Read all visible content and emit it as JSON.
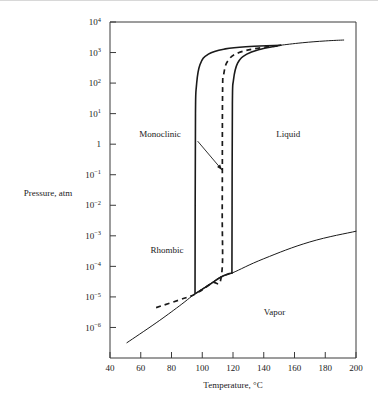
{
  "figure": {
    "name": "sulfur-phase-diagram",
    "background_color": "#ffffff",
    "line_color": "#1a1a1a"
  },
  "chart_data": {
    "type": "line",
    "title": "",
    "subtitle": "",
    "xlabel": "Temperature, °C",
    "ylabel": "Pressure, atm",
    "xlim": [
      40,
      200
    ],
    "ylim_log10": [
      -7,
      4
    ],
    "x_scale": "linear",
    "y_scale": "log",
    "grid": false,
    "legend_position": "none",
    "x_ticks": [
      40,
      60,
      80,
      100,
      120,
      140,
      160,
      180,
      200
    ],
    "x_tick_labels": [
      "40",
      "60",
      "80",
      "100",
      "120",
      "140",
      "160",
      "180",
      "200"
    ],
    "y_ticks_log10": [
      4,
      3,
      2,
      1,
      0,
      -1,
      -2,
      -3,
      -4,
      -5,
      -6
    ],
    "y_tick_labels": [
      {
        "mantissa": "10",
        "exponent": "4"
      },
      {
        "mantissa": "10",
        "exponent": "3"
      },
      {
        "mantissa": "10",
        "exponent": "2"
      },
      {
        "mantissa": "10",
        "exponent": "1"
      },
      {
        "mantissa": "1",
        "exponent": ""
      },
      {
        "mantissa": "10",
        "exponent": "−1"
      },
      {
        "mantissa": "10",
        "exponent": "−2"
      },
      {
        "mantissa": "10",
        "exponent": "−3"
      },
      {
        "mantissa": "10",
        "exponent": "−4"
      },
      {
        "mantissa": "10",
        "exponent": "−5"
      },
      {
        "mantissa": "10",
        "exponent": "−6"
      }
    ],
    "region_labels": [
      {
        "name": "rhombic",
        "text": "Rhombic",
        "x": 77,
        "y_log10": -3.55
      },
      {
        "name": "monoclinic",
        "text": "Monoclinic",
        "x": 86,
        "y_log10": 0.25
      },
      {
        "name": "liquid",
        "text": "Liquid",
        "x": 156,
        "y_log10": 0.25
      },
      {
        "name": "vapor",
        "text": "Vapor",
        "x": 147,
        "y_log10": -5.6
      }
    ],
    "annotations": [
      {
        "name": "monoclinic-leader",
        "label": "Monoclinic",
        "from_x": 97,
        "from_y_log10": 0.1,
        "to_x": 113,
        "to_y_log10": -0.85
      }
    ],
    "series": [
      {
        "name": "rhombic-monoclinic-boundary",
        "style": "solid-heavy",
        "description": "Vertical solid line from lower triple point up to the monoclinic-liquid junction near 1000 atm",
        "points": [
          {
            "x": 95.3,
            "y_log10": -4.88
          },
          {
            "x": 95.4,
            "y_log10": -2.0
          },
          {
            "x": 95.6,
            "y_log10": 1.0
          },
          {
            "x": 96.2,
            "y_log10": 1.9
          },
          {
            "x": 98.5,
            "y_log10": 2.6
          },
          {
            "x": 104.0,
            "y_log10": 2.95
          },
          {
            "x": 115.0,
            "y_log10": 3.12
          },
          {
            "x": 131.0,
            "y_log10": 3.2
          },
          {
            "x": 151.0,
            "y_log10": 3.24
          }
        ]
      },
      {
        "name": "monoclinic-liquid-boundary",
        "style": "solid-heavy",
        "description": "Vertical solid line from upper end of vaporization curve up to the high-pressure triple point",
        "points": [
          {
            "x": 119.3,
            "y_log10": -4.22
          },
          {
            "x": 119.4,
            "y_log10": -2.0
          },
          {
            "x": 119.6,
            "y_log10": 1.3
          },
          {
            "x": 120.3,
            "y_log10": 2.1
          },
          {
            "x": 123.0,
            "y_log10": 2.65
          },
          {
            "x": 129.0,
            "y_log10": 2.95
          },
          {
            "x": 138.0,
            "y_log10": 3.11
          },
          {
            "x": 151.0,
            "y_log10": 3.24
          }
        ]
      },
      {
        "name": "liquid-vapor-and-upper-branch",
        "style": "solid-thin",
        "description": "Upper continuation of the solid boundary beyond the high-pressure triple point toward 200 C",
        "points": [
          {
            "x": 151.0,
            "y_log10": 3.24
          },
          {
            "x": 165.0,
            "y_log10": 3.32
          },
          {
            "x": 180.0,
            "y_log10": 3.38
          },
          {
            "x": 192.0,
            "y_log10": 3.41
          }
        ]
      },
      {
        "name": "metastable-rhombic-monoclinic-dashed",
        "style": "dashed",
        "description": "Dashed metastable rhombic-liquid boundary, vertical near 113 C",
        "points": [
          {
            "x": 70.0,
            "y_log10": -5.35
          },
          {
            "x": 85.0,
            "y_log10": -5.1
          },
          {
            "x": 95.5,
            "y_log10": -4.9
          },
          {
            "x": 106.0,
            "y_log10": -4.55
          },
          {
            "x": 112.5,
            "y_log10": -4.3
          },
          {
            "x": 113.0,
            "y_log10": -2.0
          },
          {
            "x": 113.2,
            "y_log10": 1.6
          },
          {
            "x": 114.0,
            "y_log10": 2.3
          },
          {
            "x": 117.0,
            "y_log10": 2.75
          },
          {
            "x": 124.0,
            "y_log10": 3.0
          },
          {
            "x": 136.0,
            "y_log10": 3.14
          },
          {
            "x": 149.0,
            "y_log10": 3.22
          }
        ]
      },
      {
        "name": "sublimation-vaporization-curve",
        "style": "solid-thin",
        "description": "Thin sublimation/vaporization curve rising from about 51 C to 200 C, crossing the two lower triple points",
        "points": [
          {
            "x": 51.0,
            "y_log10": -6.5
          },
          {
            "x": 70.0,
            "y_log10": -5.85
          },
          {
            "x": 85.0,
            "y_log10": -5.3
          },
          {
            "x": 95.3,
            "y_log10": -4.9
          },
          {
            "x": 105.0,
            "y_log10": -4.58
          },
          {
            "x": 112.0,
            "y_log10": -4.34
          },
          {
            "x": 119.3,
            "y_log10": -4.22
          },
          {
            "x": 140.0,
            "y_log10": -3.75
          },
          {
            "x": 170.0,
            "y_log10": -3.2
          },
          {
            "x": 200.0,
            "y_log10": -2.85
          }
        ]
      },
      {
        "name": "lower-triple-point-hook",
        "style": "solid-heavy",
        "description": "Heavy segment of the vapor curve joining the two lower triple points at 95.3 C and 119.3 C",
        "points": [
          {
            "x": 95.3,
            "y_log10": -4.9
          },
          {
            "x": 104.0,
            "y_log10": -4.62
          },
          {
            "x": 112.0,
            "y_log10": -4.36
          },
          {
            "x": 116.5,
            "y_log10": -4.25
          },
          {
            "x": 119.3,
            "y_log10": -4.22
          }
        ]
      }
    ]
  }
}
